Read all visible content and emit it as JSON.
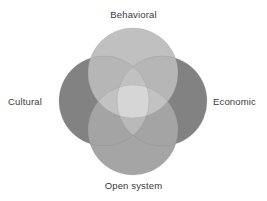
{
  "figure": {
    "type": "venn-4-circle",
    "background_color": "#ffffff",
    "center": {
      "x": 133,
      "y": 101
    },
    "circle_radius": 45,
    "circle_offset": 30,
    "labels": {
      "top": "Behavioral",
      "left": "Cultural",
      "right": "Economic",
      "bottom": "Open system"
    },
    "label_color": "#3a3a3a"
  },
  "chart_data": {
    "type": "venn",
    "title": "",
    "sets": [
      {
        "name": "Behavioral",
        "position": "top",
        "color": "#a8a8a8",
        "opacity": 0.78,
        "cx": 133,
        "cy": 73,
        "r": 45
      },
      {
        "name": "Cultural",
        "position": "left",
        "color": "#6e6e6e",
        "opacity": 0.82,
        "cx": 104,
        "cy": 101,
        "r": 45
      },
      {
        "name": "Economic",
        "position": "right",
        "color": "#6e6e6e",
        "opacity": 0.82,
        "cx": 162,
        "cy": 101,
        "r": 45
      },
      {
        "name": "Open system",
        "position": "bottom",
        "color": "#8a8a8a",
        "opacity": 0.8,
        "cx": 133,
        "cy": 130,
        "r": 45
      }
    ],
    "intersection_center_label": "",
    "legend": "none",
    "grid": false
  }
}
